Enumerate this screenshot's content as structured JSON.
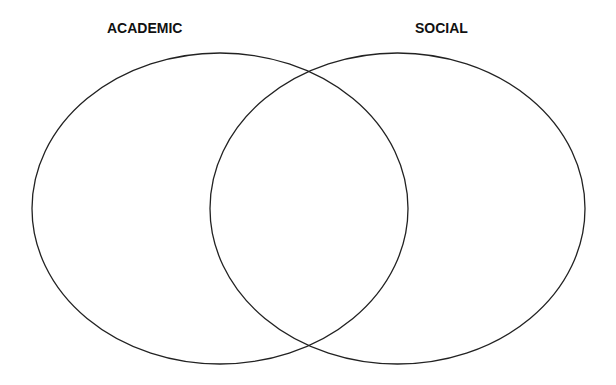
{
  "diagram": {
    "type": "venn",
    "sets": [
      {
        "id": "left",
        "label": "ACADEMIC",
        "cx": 220,
        "cy": 208.5,
        "rx": 188,
        "ry": 155.5
      },
      {
        "id": "right",
        "label": "SOCIAL",
        "cx": 397.5,
        "cy": 208.5,
        "rx": 187.5,
        "ry": 155.5
      }
    ],
    "stroke_color": "#222222",
    "background_color": "#ffffff"
  }
}
